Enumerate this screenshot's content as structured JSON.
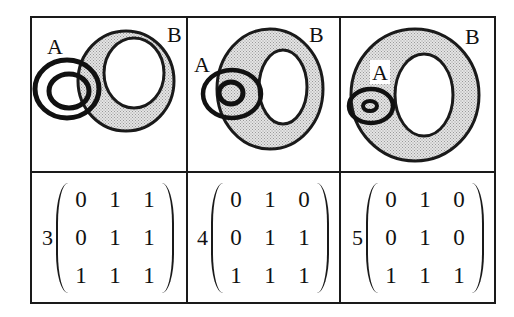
{
  "figure": {
    "shade_color": "#c8c8c8",
    "line_color": "#1a1a1a",
    "panels": [
      {
        "index": 3,
        "set_a_label": "A",
        "set_b_label": "B",
        "description": "A (two concentric rings) overlaps the shaded annulus B from the left",
        "matrix": [
          [
            0,
            1,
            1
          ],
          [
            0,
            1,
            1
          ],
          [
            1,
            1,
            1
          ]
        ]
      },
      {
        "index": 4,
        "set_a_label": "A",
        "set_b_label": "B",
        "description": "A ring partially inside shaded annulus B; inner ring of A inside B",
        "matrix": [
          [
            0,
            1,
            0
          ],
          [
            0,
            1,
            1
          ],
          [
            1,
            1,
            1
          ]
        ]
      },
      {
        "index": 5,
        "set_a_label": "A",
        "set_b_label": "B",
        "description": "A (small concentric rings) fully inside the shaded annulus of B, touching inner hole",
        "matrix": [
          [
            0,
            1,
            0
          ],
          [
            0,
            1,
            0
          ],
          [
            1,
            1,
            1
          ]
        ]
      }
    ]
  },
  "labels": {
    "p0": {
      "num": "3",
      "a": "A",
      "b": "B",
      "m": [
        [
          "0",
          "1",
          "1"
        ],
        [
          "0",
          "1",
          "1"
        ],
        [
          "1",
          "1",
          "1"
        ]
      ]
    },
    "p1": {
      "num": "4",
      "a": "A",
      "b": "B",
      "m": [
        [
          "0",
          "1",
          "0"
        ],
        [
          "0",
          "1",
          "1"
        ],
        [
          "1",
          "1",
          "1"
        ]
      ]
    },
    "p2": {
      "num": "5",
      "a": "A",
      "b": "B",
      "m": [
        [
          "0",
          "1",
          "0"
        ],
        [
          "0",
          "1",
          "0"
        ],
        [
          "1",
          "1",
          "1"
        ]
      ]
    }
  }
}
